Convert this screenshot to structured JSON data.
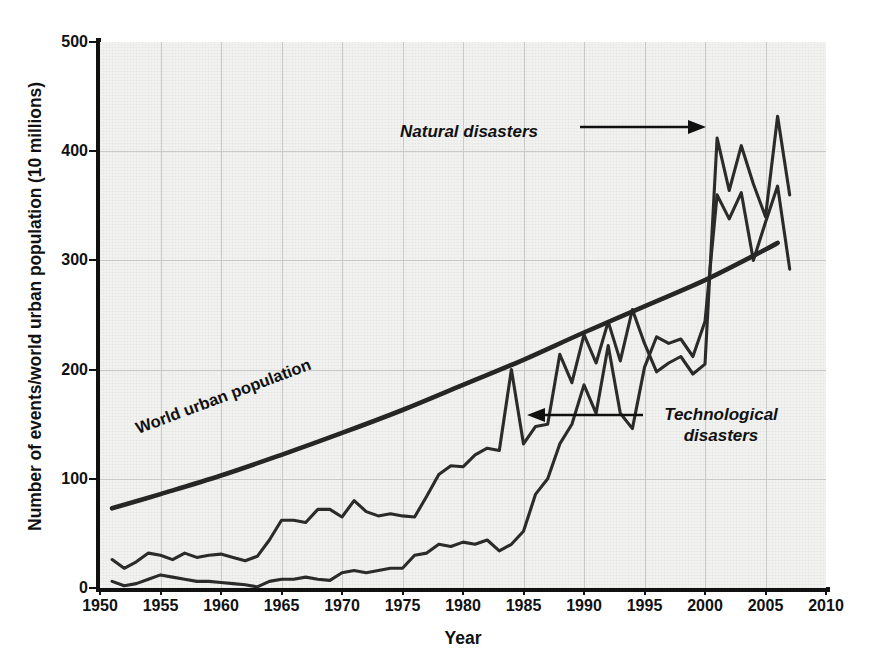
{
  "figure": {
    "xlabel": "Year",
    "ylabel": "Number of events/world urban population (10 millions)"
  },
  "annotations": {
    "natural": "Natural disasters",
    "technological_line1": "Technological",
    "technological_line2": "disasters",
    "population": "World urban population"
  },
  "colors": {
    "plot_background": "#f2f2f1",
    "gridline": "#c9c9c9",
    "axis": "#111111",
    "series_line": "#2b2b2b",
    "population_line": "#262626"
  },
  "chart_data": {
    "type": "line",
    "title": "",
    "xlabel": "Year",
    "ylabel": "Number of events/world urban population (10 millions)",
    "xlim": [
      1950,
      2010
    ],
    "ylim": [
      0,
      500
    ],
    "xticks": [
      1950,
      1955,
      1960,
      1965,
      1970,
      1975,
      1980,
      1985,
      1990,
      1995,
      2000,
      2005,
      2010
    ],
    "yticks": [
      0,
      100,
      200,
      300,
      400,
      500
    ],
    "grid": true,
    "legend": "inline-annotations",
    "series": [
      {
        "name": "Natural disasters",
        "x": [
          1951,
          1952,
          1953,
          1954,
          1955,
          1956,
          1957,
          1958,
          1959,
          1960,
          1961,
          1962,
          1963,
          1964,
          1965,
          1966,
          1967,
          1968,
          1969,
          1970,
          1971,
          1972,
          1973,
          1974,
          1975,
          1976,
          1977,
          1978,
          1979,
          1980,
          1981,
          1982,
          1983,
          1984,
          1985,
          1986,
          1987,
          1988,
          1989,
          1990,
          1991,
          1992,
          1993,
          1994,
          1995,
          1996,
          1997,
          1998,
          1999,
          2000,
          2001,
          2002,
          2003,
          2004,
          2005,
          2006,
          2007
        ],
        "values": [
          26,
          18,
          24,
          32,
          30,
          26,
          32,
          28,
          30,
          31,
          28,
          25,
          29,
          44,
          62,
          62,
          60,
          72,
          72,
          65,
          80,
          70,
          66,
          68,
          66,
          65,
          84,
          104,
          112,
          111,
          122,
          128,
          126,
          200,
          132,
          148,
          150,
          214,
          188,
          232,
          206,
          244,
          208,
          255,
          224,
          198,
          206,
          212,
          196,
          205,
          412,
          364,
          405,
          370,
          340,
          432,
          360
        ]
      },
      {
        "name": "Technological disasters",
        "x": [
          1951,
          1952,
          1953,
          1954,
          1955,
          1956,
          1957,
          1958,
          1959,
          1960,
          1961,
          1962,
          1963,
          1964,
          1965,
          1966,
          1967,
          1968,
          1969,
          1970,
          1971,
          1972,
          1973,
          1974,
          1975,
          1976,
          1977,
          1978,
          1979,
          1980,
          1981,
          1982,
          1983,
          1984,
          1985,
          1986,
          1987,
          1988,
          1989,
          1990,
          1991,
          1992,
          1993,
          1994,
          1995,
          1996,
          1997,
          1998,
          1999,
          2000,
          2001,
          2002,
          2003,
          2004,
          2005,
          2006,
          2007
        ],
        "values": [
          6,
          2,
          4,
          8,
          12,
          10,
          8,
          6,
          6,
          5,
          4,
          3,
          1,
          6,
          8,
          8,
          10,
          8,
          7,
          14,
          16,
          14,
          16,
          18,
          18,
          30,
          32,
          40,
          38,
          42,
          40,
          44,
          34,
          40,
          52,
          86,
          100,
          132,
          150,
          186,
          160,
          222,
          160,
          146,
          202,
          230,
          224,
          228,
          212,
          244,
          360,
          338,
          362,
          300,
          335,
          368,
          292
        ]
      },
      {
        "name": "World urban population",
        "x": [
          1951,
          1955,
          1960,
          1965,
          1970,
          1975,
          1980,
          1985,
          1990,
          1995,
          2000,
          2005,
          2006
        ],
        "values": [
          73,
          86,
          103,
          122,
          142,
          163,
          186,
          209,
          234,
          258,
          282,
          310,
          316
        ]
      }
    ]
  }
}
